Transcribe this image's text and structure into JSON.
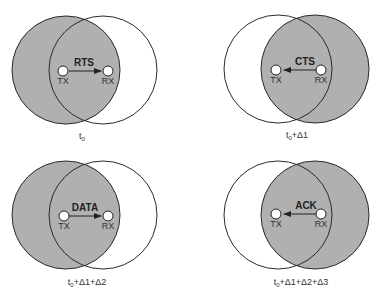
{
  "colors": {
    "shaded": "#b0b0b0",
    "stroke": "#2a2a2a",
    "node_fill": "#ffffff",
    "text": "#222222"
  },
  "panels": [
    {
      "id": "rts",
      "message": "RTS",
      "direction": "TX->RX",
      "shaded_node": "TX",
      "tx_label": "TX",
      "rx_label": "RX",
      "time_label": {
        "base": "t",
        "sub": "0",
        "rest": ""
      }
    },
    {
      "id": "cts",
      "message": "CTS",
      "direction": "RX->TX",
      "shaded_node": "RX",
      "tx_label": "TX",
      "rx_label": "RX",
      "time_label": {
        "base": "t",
        "sub": "0",
        "rest": "+Δ1"
      }
    },
    {
      "id": "data",
      "message": "DATA",
      "direction": "TX->RX",
      "shaded_node": "TX",
      "tx_label": "TX",
      "rx_label": "RX",
      "time_label": {
        "base": "t",
        "sub": "0",
        "rest": "+Δ1+Δ2"
      }
    },
    {
      "id": "ack",
      "message": "ACK",
      "direction": "RX->TX",
      "shaded_node": "RX",
      "tx_label": "TX",
      "rx_label": "RX",
      "time_label": {
        "base": "t",
        "sub": "0",
        "rest": "+Δ1+Δ2+Δ3"
      }
    }
  ]
}
